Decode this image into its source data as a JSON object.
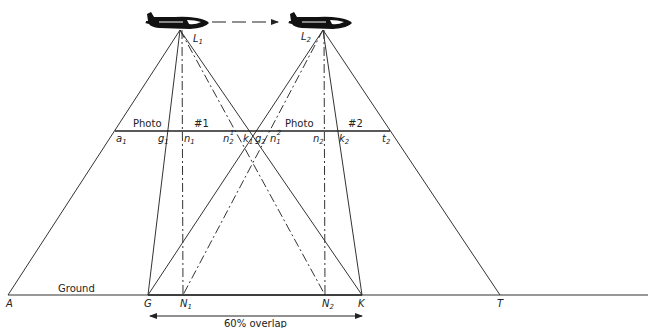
{
  "diagram": {
    "exposure_stations": [
      {
        "label": "L",
        "sub": "1",
        "x": 180,
        "y": 30
      },
      {
        "label": "L",
        "sub": "2",
        "x": 323,
        "y": 30
      }
    ],
    "photo_line": {
      "y": 131,
      "x_start": 115,
      "x_end": 390,
      "photo1_label": "Photo",
      "photo1_number": "#1",
      "photo2_label": "Photo",
      "photo2_number": "#2",
      "image_points": [
        {
          "label": "a",
          "sub": "1",
          "sup": ""
        },
        {
          "label": "g",
          "sub": "1",
          "sup": ""
        },
        {
          "label": "n",
          "sub": "1",
          "sup": ""
        },
        {
          "label": "n",
          "sub": "2",
          "sup": "1"
        },
        {
          "label": "k",
          "sub": "1",
          "sup": ""
        },
        {
          "label": "g",
          "sub": "2",
          "sup": ""
        },
        {
          "label": "n",
          "sub": "1",
          "sup": "2"
        },
        {
          "label": "n",
          "sub": "2",
          "sup": ""
        },
        {
          "label": "k",
          "sub": "2",
          "sup": ""
        },
        {
          "label": "t",
          "sub": "2",
          "sup": ""
        }
      ]
    },
    "ground_line": {
      "y": 295,
      "label": "Ground",
      "points": [
        {
          "label": "A",
          "sub": "",
          "x": 8
        },
        {
          "label": "G",
          "sub": "",
          "x": 148
        },
        {
          "label": "N",
          "sub": "1",
          "x": 183
        },
        {
          "label": "N",
          "sub": "2",
          "x": 325
        },
        {
          "label": "K",
          "sub": "",
          "x": 362
        },
        {
          "label": "T",
          "sub": "",
          "x": 500
        }
      ]
    },
    "overlap": {
      "label": "60% overlap",
      "from": "G",
      "to": "K"
    },
    "flight_arrow": {
      "from": "L1",
      "to": "L2"
    }
  }
}
